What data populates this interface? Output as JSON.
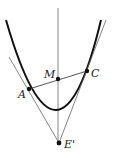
{
  "diagram": {
    "title": "",
    "labels": {
      "A": "A",
      "C": "C",
      "M": "M",
      "E": "E'"
    },
    "points": {
      "A": [
        29,
        89
      ],
      "C": [
        87,
        71
      ],
      "M": [
        58,
        79
      ],
      "E": [
        59,
        143
      ]
    },
    "colors": {
      "curve": "#111111",
      "lines": "#555555",
      "points": "#111111"
    }
  }
}
